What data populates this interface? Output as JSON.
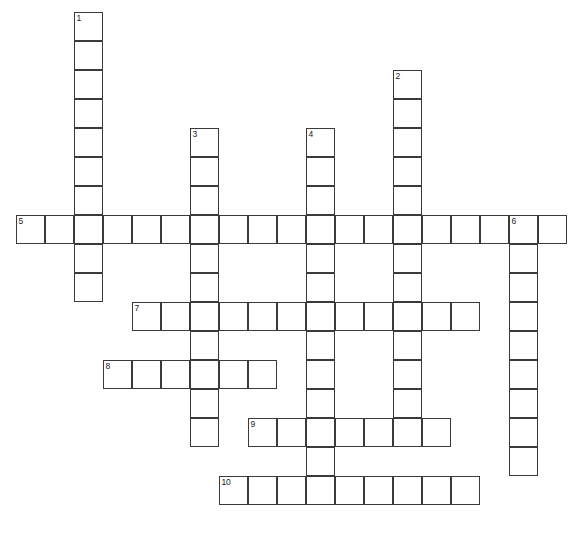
{
  "puzzle": {
    "kind": "crossword-grid",
    "title": "",
    "canvas": {
      "width": 580,
      "height": 535,
      "background": "#ffffff"
    },
    "geometry": {
      "cell_size": 29,
      "origin_x": 16,
      "origin_y": 12,
      "border_color": "#3a3a3a",
      "border_width": 1.6,
      "cell_fill": "#ffffff"
    },
    "entry_count": 10,
    "entries": [
      {
        "number": "1",
        "label": "1",
        "direction": "down",
        "col": 2,
        "row": 0,
        "length": 10
      },
      {
        "number": "2",
        "label": "2",
        "direction": "down",
        "col": 13,
        "row": 2,
        "length": 12
      },
      {
        "number": "3",
        "label": "3",
        "direction": "down",
        "col": 6,
        "row": 4,
        "length": 11
      },
      {
        "number": "4",
        "label": "4",
        "direction": "down",
        "col": 10,
        "row": 4,
        "length": 13
      },
      {
        "number": "5",
        "label": "5",
        "direction": "across",
        "col": 0,
        "row": 7,
        "length": 19
      },
      {
        "number": "6",
        "label": "6",
        "direction": "down",
        "col": 17,
        "row": 7,
        "length": 9
      },
      {
        "number": "7",
        "label": "7",
        "direction": "across",
        "col": 4,
        "row": 10,
        "length": 12
      },
      {
        "number": "8",
        "label": "8",
        "direction": "across",
        "col": 3,
        "row": 12,
        "length": 6
      },
      {
        "number": "9",
        "label": "9",
        "direction": "across",
        "col": 8,
        "row": 14,
        "length": 7
      },
      {
        "number": "10",
        "label": "10",
        "direction": "across",
        "col": 7,
        "row": 16,
        "length": 9
      }
    ],
    "numbered_cells": [
      {
        "label": "1",
        "col": 2,
        "row": 0
      },
      {
        "label": "2",
        "col": 13,
        "row": 2
      },
      {
        "label": "3",
        "col": 6,
        "row": 4
      },
      {
        "label": "4",
        "col": 10,
        "row": 4
      },
      {
        "label": "5",
        "col": 0,
        "row": 7
      },
      {
        "label": "6",
        "col": 17,
        "row": 7
      },
      {
        "label": "7",
        "col": 4,
        "row": 10
      },
      {
        "label": "8",
        "col": 3,
        "row": 12
      },
      {
        "label": "9",
        "col": 8,
        "row": 14
      },
      {
        "label": "10",
        "col": 7,
        "row": 16
      }
    ]
  }
}
